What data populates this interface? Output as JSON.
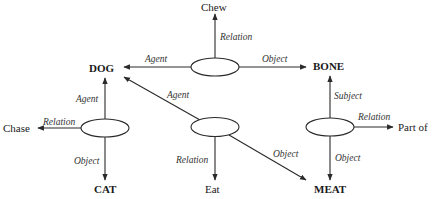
{
  "diagram": {
    "type": "semantic-network",
    "concepts": {
      "dog": "DOG",
      "bone": "BONE",
      "cat": "CAT",
      "meat": "MEAT"
    },
    "relations": {
      "chew": "Chew",
      "chase": "Chase",
      "eat": "Eat",
      "part_of": "Part of"
    },
    "edge_labels": {
      "chew_agent": "Agent",
      "chew_relation": "Relation",
      "chew_object": "Object",
      "chase_agent": "Agent",
      "chase_relation": "Relation",
      "chase_object": "Object",
      "eat_agent": "Agent",
      "eat_relation": "Relation",
      "eat_object": "Object",
      "partof_subject": "Subject",
      "partof_relation": "Relation",
      "partof_object": "Object"
    },
    "propositions": [
      {
        "node": "chew-node",
        "agent": "DOG",
        "relation": "Chew",
        "object": "BONE"
      },
      {
        "node": "chase-node",
        "agent": "DOG",
        "relation": "Chase",
        "object": "CAT"
      },
      {
        "node": "eat-node",
        "agent": "DOG",
        "relation": "Eat",
        "object": "MEAT"
      },
      {
        "node": "partof-node",
        "subject": "BONE",
        "relation": "Part of",
        "object": "MEAT"
      }
    ],
    "colors": {
      "stroke": "#2a2a2a",
      "text": "#1a1a1a",
      "background": "#ffffff"
    }
  }
}
